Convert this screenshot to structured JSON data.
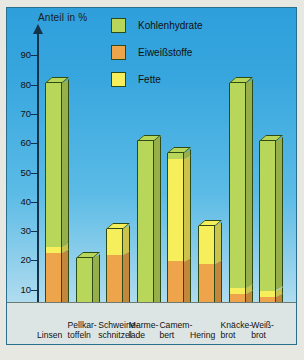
{
  "chart_data": {
    "type": "bar",
    "title": "Anteil in %",
    "xlabel": "",
    "ylabel": "Anteil in %",
    "ylim": [
      0,
      95
    ],
    "yticks": [
      0,
      10,
      20,
      30,
      40,
      50,
      60,
      70,
      80,
      90
    ],
    "grid": false,
    "legend_position": "top-right",
    "stacked": true,
    "categories": [
      "Linsen",
      "Pellkartoffeln",
      "Schweineschnitzel",
      "Marmelade",
      "Camembert",
      "Hering",
      "Knäckebrot",
      "Weißbrot"
    ],
    "series": [
      {
        "name": "Eiweißstoffe",
        "color": "#efa councilor"
      }
    ],
    "series_data": [
      {
        "name": "Eiweißstoffe",
        "color": "#eda44a",
        "values": [
          22,
          2,
          21,
          0.5,
          19,
          18,
          8,
          7
        ]
      },
      {
        "name": "Fette",
        "color": "#f7ee5c",
        "values": [
          2,
          0,
          9,
          0,
          35,
          13,
          2,
          2
        ]
      },
      {
        "name": "Kohlenhydrate",
        "color": "#b8d65a",
        "values": [
          56,
          18,
          0,
          60,
          2,
          0,
          70,
          51
        ]
      }
    ],
    "totals": [
      80,
      20,
      30,
      60,
      56,
      31,
      80,
      60
    ],
    "annotations": []
  },
  "chart": {
    "axis_title": "Anteil in %",
    "ylabels": [
      "90",
      "80",
      "70",
      "60",
      "50",
      "40",
      "30",
      "20",
      "10",
      "0"
    ]
  },
  "legend": {
    "items": [
      {
        "label": "Kohlenhydrate",
        "color": "#b8d65a"
      },
      {
        "label": "Eiweißstoffe",
        "color": "#eda44a"
      },
      {
        "label": "Fette",
        "color": "#f7ee5c"
      }
    ]
  },
  "xlabels": [
    {
      "line1": "Linsen",
      "line2": ""
    },
    {
      "line1": "Pellkar-",
      "line2": "toffeln"
    },
    {
      "line1": "Schweine-",
      "line2": "schnitzel"
    },
    {
      "line1": "Marme-",
      "line2": "lade"
    },
    {
      "line1": "Camem-",
      "line2": "bert"
    },
    {
      "line1": "Hering",
      "line2": ""
    },
    {
      "line1": "Knäcke-",
      "line2": "brot"
    },
    {
      "line1": "Weiß-",
      "line2": "brot"
    }
  ]
}
